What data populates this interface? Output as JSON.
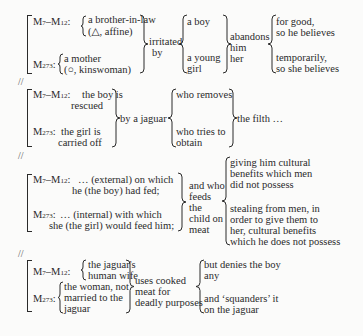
{
  "separator": "//",
  "blocks": [
    {
      "row1_label": "M7–M12:",
      "row2_label": "M273:",
      "row1_subject": [
        "a brother-in-law",
        "(△, affine)"
      ],
      "row2_subject": [
        "a mother",
        "(○, kinswoman)"
      ],
      "verb": [
        "irritated",
        "by"
      ],
      "object_1": "a boy",
      "object_2": [
        "a young",
        "girl"
      ],
      "action": [
        "abandons",
        "him",
        "her"
      ],
      "result_1": [
        "for good,",
        "so he believes"
      ],
      "result_2": [
        "temporarily,",
        "so she believes"
      ]
    },
    {
      "row1_label": "M7–M12:",
      "row2_label": "M273:",
      "row1_text": [
        "the boy is",
        "rescued"
      ],
      "row2_text": [
        "the girl is",
        "carried off"
      ],
      "agent": "by a jaguar",
      "clause_1": "who removes",
      "clause_2": [
        "who tries to",
        "obtain"
      ],
      "object": "the filth …"
    },
    {
      "row1_label": "M7–M12:",
      "row2_label": "M273:",
      "row1_text": [
        "… (external) on which",
        "he (the boy) had fed;"
      ],
      "row2_text": [
        "… (internal) with which",
        "she (the girl) would feed him;"
      ],
      "middle": [
        "and who",
        "feeds",
        "the",
        "child on",
        "meat"
      ],
      "result_1": [
        "giving him cultural",
        "benefits which men",
        "did not possess"
      ],
      "result_2": [
        "stealing from men, in",
        "order to give them to",
        "her, cultural benefits",
        "which he does not possess"
      ]
    },
    {
      "row1_label": "M7–M12:",
      "row2_label": "M273:",
      "row1_subject": [
        "the jaguar's",
        "human wife"
      ],
      "row2_subject": [
        "the woman, not",
        "married to the",
        "jaguar"
      ],
      "verb": [
        "uses cooked",
        "meat for",
        "deadly purposes"
      ],
      "result_1": [
        "but denies the boy",
        "any"
      ],
      "result_2": [
        "and ‘squanders’ it",
        "on the jaguar"
      ]
    }
  ]
}
